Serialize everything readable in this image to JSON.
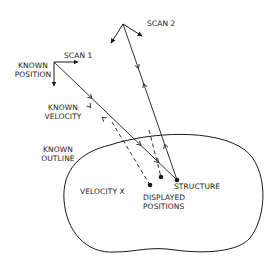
{
  "diagram": {
    "type": "tracking-scan-schematic",
    "colors": {
      "ink": "#1a1a1a",
      "background": "#ffffff"
    },
    "labels": {
      "scan1": "SCAN 1",
      "scan2": "SCAN 2",
      "known_position_1": "KNOWN",
      "known_position_2": "POSITION",
      "known_velocity_1": "KNOWN",
      "known_velocity_2": "VELOCITY",
      "known_outline_1": "KNOWN",
      "known_outline_2": "OUTLINE",
      "velocity_x": "VELOCITY X",
      "structure": "STRUCTURE",
      "displayed_positions_1": "DISPLAYED",
      "displayed_positions_2": "POSITIONS"
    },
    "nodes": [
      {
        "id": "scan1-origin",
        "x": 54,
        "y": 62
      },
      {
        "id": "scan2-origin",
        "x": 123,
        "y": 24
      },
      {
        "id": "structure",
        "x": 177,
        "y": 180
      },
      {
        "id": "displayed-position-1",
        "x": 150,
        "y": 185
      },
      {
        "id": "displayed-position-2",
        "x": 161,
        "y": 177
      }
    ],
    "edges": [
      {
        "from": "scan1-origin",
        "to": "structure",
        "style": "solid",
        "arrows": "bidirectional"
      },
      {
        "from": "scan2-origin",
        "to": "structure",
        "style": "solid",
        "arrows": "bidirectional"
      },
      {
        "from": "scan1-origin",
        "to": "displayed-position-1",
        "style": "dashed"
      },
      {
        "from": "scan2-origin",
        "to": "displayed-position-2",
        "style": "dashed"
      }
    ]
  }
}
